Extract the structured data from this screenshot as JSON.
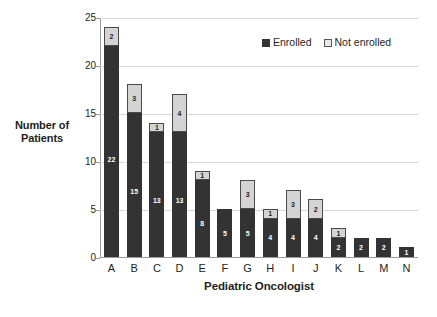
{
  "chart_data": {
    "type": "bar",
    "subtype": "stacked-bar",
    "title": "",
    "xlabel": "Pediatric Oncologist",
    "ylabel": "Number of Patients",
    "ylabel_lines": [
      "Number of",
      "Patients"
    ],
    "categories": [
      "A",
      "B",
      "C",
      "D",
      "E",
      "F",
      "G",
      "H",
      "I",
      "J",
      "K",
      "L",
      "M",
      "N"
    ],
    "series": [
      {
        "name": "Enrolled",
        "color": "#333333",
        "values": [
          22,
          15,
          13,
          13,
          8,
          5,
          5,
          4,
          4,
          4,
          2,
          2,
          2,
          1
        ]
      },
      {
        "name": "Not enrolled",
        "color": "#d4d4d4",
        "values": [
          2,
          3,
          1,
          4,
          1,
          0,
          3,
          1,
          3,
          2,
          1,
          0,
          0,
          0
        ]
      }
    ],
    "totals": [
      24,
      18,
      14,
      17,
      9,
      5,
      8,
      5,
      7,
      6,
      3,
      2,
      2,
      1
    ],
    "ylim": [
      0,
      25
    ],
    "yticks": [
      0,
      5,
      10,
      15,
      20,
      25
    ],
    "ytick_labels": [
      "0",
      "5",
      "10",
      "15",
      "20",
      "25"
    ],
    "grid": true,
    "grid_axis": "y",
    "legend_position": "top-right",
    "data_labels": true
  },
  "legend": {
    "items": [
      {
        "label": "Enrolled",
        "swatch": "dark-square-swatch"
      },
      {
        "label": "Not enrolled",
        "swatch": "light-square-swatch"
      }
    ]
  },
  "caption": {
    "text": ""
  }
}
